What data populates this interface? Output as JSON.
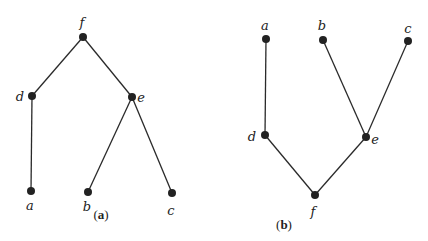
{
  "diagrams": [
    {
      "caption": {
        "open": "(",
        "letter": "a",
        "close": ")"
      },
      "nodes": [
        {
          "id": "f",
          "label": "f",
          "x": 83,
          "y": 37,
          "lx": 82,
          "ly": 27
        },
        {
          "id": "d",
          "label": "d",
          "x": 32,
          "y": 96,
          "lx": 20,
          "ly": 101
        },
        {
          "id": "e",
          "label": "e",
          "x": 132,
          "y": 97,
          "lx": 141,
          "ly": 102
        },
        {
          "id": "a",
          "label": "a",
          "x": 31,
          "y": 191,
          "lx": 30,
          "ly": 210
        },
        {
          "id": "b",
          "label": "b",
          "x": 88,
          "y": 192,
          "lx": 87,
          "ly": 211
        },
        {
          "id": "c",
          "label": "c",
          "x": 172,
          "y": 193,
          "lx": 171,
          "ly": 215
        }
      ],
      "edges": [
        [
          "f",
          "d"
        ],
        [
          "f",
          "e"
        ],
        [
          "d",
          "a"
        ],
        [
          "e",
          "b"
        ],
        [
          "e",
          "c"
        ]
      ],
      "caption_pos": {
        "x": 101,
        "y": 219
      }
    },
    {
      "caption": {
        "open": "(",
        "letter": "b",
        "close": ")"
      },
      "nodes": [
        {
          "id": "a",
          "label": "a",
          "x": 266,
          "y": 39,
          "lx": 265,
          "ly": 30
        },
        {
          "id": "b",
          "label": "b",
          "x": 323,
          "y": 40,
          "lx": 322,
          "ly": 30
        },
        {
          "id": "c",
          "label": "c",
          "x": 408,
          "y": 41,
          "lx": 408,
          "ly": 33
        },
        {
          "id": "d",
          "label": "d",
          "x": 265,
          "y": 135,
          "lx": 252,
          "ly": 141
        },
        {
          "id": "e",
          "label": "e",
          "x": 366,
          "y": 137,
          "lx": 375,
          "ly": 144
        },
        {
          "id": "f",
          "label": "f",
          "x": 315,
          "y": 195,
          "lx": 313,
          "ly": 216
        }
      ],
      "edges": [
        [
          "a",
          "d"
        ],
        [
          "b",
          "e"
        ],
        [
          "c",
          "e"
        ],
        [
          "d",
          "f"
        ],
        [
          "e",
          "f"
        ]
      ],
      "caption_pos": {
        "x": 284,
        "y": 229
      }
    }
  ]
}
